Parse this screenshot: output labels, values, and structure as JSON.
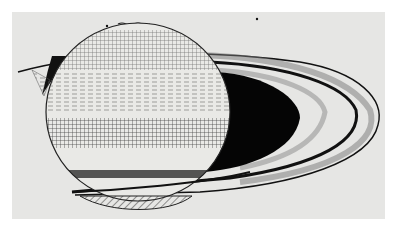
{
  "image": {
    "subject": "Hand-drawn sketch of the planet Saturn with its rings",
    "caption": "~~~~~",
    "colors": {
      "paper": "#e6e6e4",
      "border": "#ffffff",
      "ink": "#111111",
      "shadow": "#050505"
    }
  }
}
